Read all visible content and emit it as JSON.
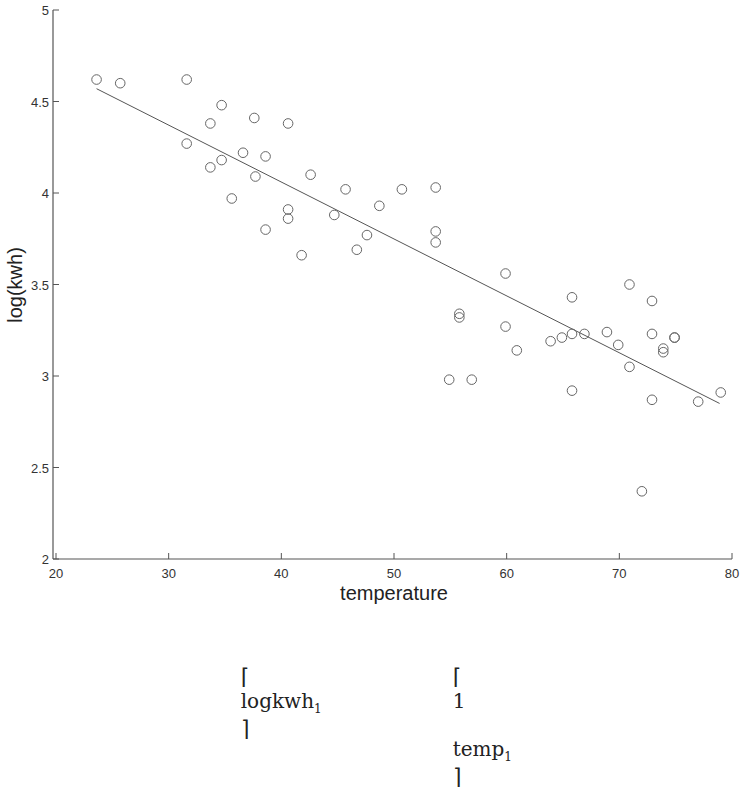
{
  "chart_data": {
    "type": "scatter",
    "title": "",
    "xlabel": "temperature",
    "ylabel": "log(kwh)",
    "xlim": [
      20,
      80
    ],
    "ylim": [
      2,
      5
    ],
    "xticks": [
      20,
      30,
      40,
      50,
      60,
      70,
      80
    ],
    "yticks": [
      2,
      2.5,
      3,
      3.5,
      4,
      4.5,
      5
    ],
    "xtick_labels": [
      "20",
      "30",
      "40",
      "50",
      "60",
      "70",
      "80"
    ],
    "ytick_labels": [
      "2",
      "2.5",
      "3",
      "3.5",
      "4",
      "4.5",
      "5"
    ],
    "grid": false,
    "legend": null,
    "marker": "open-circle",
    "series": [
      {
        "name": "observations",
        "points": [
          [
            23.6,
            4.62
          ],
          [
            25.7,
            4.6
          ],
          [
            31.6,
            4.62
          ],
          [
            31.6,
            4.27
          ],
          [
            33.7,
            4.38
          ],
          [
            33.7,
            4.14
          ],
          [
            34.7,
            4.48
          ],
          [
            34.7,
            4.18
          ],
          [
            35.6,
            3.97
          ],
          [
            36.6,
            4.22
          ],
          [
            37.6,
            4.41
          ],
          [
            37.7,
            4.09
          ],
          [
            38.6,
            4.2
          ],
          [
            38.6,
            3.8
          ],
          [
            40.6,
            4.38
          ],
          [
            40.6,
            3.91
          ],
          [
            40.6,
            3.86
          ],
          [
            41.8,
            3.66
          ],
          [
            42.6,
            4.1
          ],
          [
            44.7,
            3.88
          ],
          [
            45.7,
            4.02
          ],
          [
            46.7,
            3.69
          ],
          [
            47.6,
            3.77
          ],
          [
            48.7,
            3.93
          ],
          [
            50.7,
            4.02
          ],
          [
            53.7,
            4.03
          ],
          [
            53.7,
            3.79
          ],
          [
            53.7,
            3.73
          ],
          [
            54.9,
            2.98
          ],
          [
            55.8,
            3.34
          ],
          [
            55.8,
            3.32
          ],
          [
            56.9,
            2.98
          ],
          [
            59.9,
            3.56
          ],
          [
            59.9,
            3.27
          ],
          [
            60.9,
            3.14
          ],
          [
            63.9,
            3.19
          ],
          [
            64.9,
            3.21
          ],
          [
            65.8,
            3.43
          ],
          [
            65.8,
            3.23
          ],
          [
            65.8,
            2.92
          ],
          [
            66.9,
            3.23
          ],
          [
            68.9,
            3.24
          ],
          [
            69.9,
            3.17
          ],
          [
            70.9,
            3.5
          ],
          [
            70.9,
            3.05
          ],
          [
            72.0,
            2.37
          ],
          [
            72.9,
            3.41
          ],
          [
            72.9,
            3.23
          ],
          [
            72.9,
            2.87
          ],
          [
            73.9,
            3.15
          ],
          [
            73.9,
            3.13
          ],
          [
            74.9,
            3.21
          ],
          [
            74.9,
            3.21
          ],
          [
            77.0,
            2.86
          ],
          [
            79.0,
            2.91
          ]
        ]
      },
      {
        "name": "fitted line",
        "type": "line",
        "points": [
          [
            23.6,
            4.57
          ],
          [
            78.9,
            2.85
          ]
        ]
      }
    ]
  },
  "equation": {
    "left_bracket": "⌈",
    "right_bracket": "⌉",
    "lhs_entry": "logkwh",
    "lhs_sub": "1",
    "rhs_col1": "1",
    "rhs_col2": "temp",
    "rhs_sub": "1"
  }
}
